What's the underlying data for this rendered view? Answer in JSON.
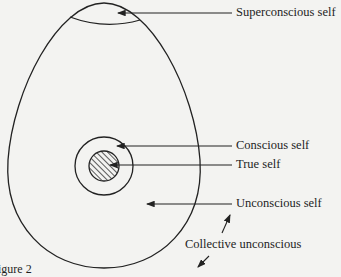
{
  "diagram": {
    "type": "egg-diagram",
    "labels": {
      "superconscious": "Superconscious self",
      "conscious": "Conscious self",
      "true_self": "True self",
      "unconscious": "Unconscious self",
      "collective": "Collective unconscious",
      "caption": "igure 2"
    },
    "colors": {
      "line": "#222222",
      "background": "#f3f3f1"
    }
  }
}
